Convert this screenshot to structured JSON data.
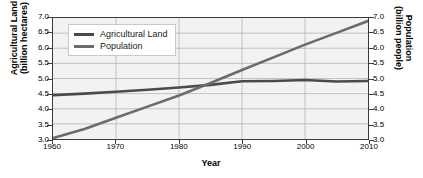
{
  "chart_data": {
    "type": "line",
    "title": "",
    "xlabel": "Year",
    "ylabel": "Agricultural Land\n(billion hectares)",
    "y2label": "Population\n(billion people)",
    "xlim": [
      1960,
      2010
    ],
    "ylim": [
      3.0,
      7.0
    ],
    "y2lim": [
      3.0,
      7.0
    ],
    "grid": true,
    "legend_position": "upper-left",
    "xticks": [
      "1960",
      "1970",
      "1980",
      "1990",
      "2000",
      "2010"
    ],
    "xtick_values": [
      1960,
      1970,
      1980,
      1990,
      2000,
      2010
    ],
    "yticks": [
      "3.0",
      "3.5",
      "4.0",
      "4.5",
      "5.0",
      "5.5",
      "6.0",
      "6.5",
      "7.0"
    ],
    "ytick_values": [
      3.0,
      3.5,
      4.0,
      4.5,
      5.0,
      5.5,
      6.0,
      6.5,
      7.0
    ],
    "y2ticks": [
      "3.0",
      "3.5",
      "4.0",
      "4.5",
      "5.0",
      "5.5",
      "6.0",
      "6.5",
      "7.0"
    ],
    "y2tick_values": [
      3.0,
      3.5,
      4.0,
      4.5,
      5.0,
      5.5,
      6.0,
      6.5,
      7.0
    ],
    "x": [
      1960,
      1965,
      1970,
      1975,
      1980,
      1985,
      1990,
      1995,
      2000,
      2005,
      2010
    ],
    "series": [
      {
        "name": "Agricultural Land",
        "axis": "left",
        "color": "#4a4a4a",
        "values": [
          4.45,
          4.5,
          4.56,
          4.63,
          4.7,
          4.79,
          4.91,
          4.92,
          4.95,
          4.9,
          4.92
        ]
      },
      {
        "name": "Population",
        "axis": "right",
        "color": "#6b6b6b",
        "values": [
          3.03,
          3.33,
          3.7,
          4.07,
          4.44,
          4.85,
          5.28,
          5.7,
          6.12,
          6.51,
          6.9
        ]
      }
    ],
    "annotations": []
  },
  "legend": {
    "items": [
      {
        "label": "Agricultural Land",
        "color": "#4a4a4a"
      },
      {
        "label": "Population",
        "color": "#6b6b6b"
      }
    ]
  },
  "axes": {
    "x_title": "Year",
    "y_left_title": "Agricultural Land\n(billion hectares)",
    "y_right_title": "Population\n(billion people)"
  }
}
